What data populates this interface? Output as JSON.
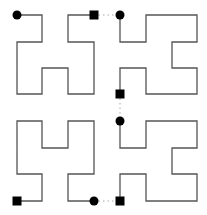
{
  "diagram": {
    "title": "",
    "colors": {
      "path": "#555555",
      "marker": "#000000",
      "connector": "#aaaaaa",
      "background": "#ffffff"
    },
    "segments": [
      {
        "id": "q1",
        "start_marker": "circle",
        "end_marker": "square",
        "points": [
          [
            17,
            15
          ],
          [
            42,
            15
          ],
          [
            42,
            42
          ],
          [
            17,
            42
          ],
          [
            17,
            94
          ],
          [
            42,
            94
          ],
          [
            42,
            68
          ],
          [
            68,
            68
          ],
          [
            68,
            94
          ],
          [
            94,
            94
          ],
          [
            94,
            42
          ],
          [
            68,
            42
          ],
          [
            68,
            15
          ],
          [
            94,
            15
          ]
        ]
      },
      {
        "id": "q2",
        "start_marker": "circle",
        "end_marker": "square",
        "points": [
          [
            120,
            15
          ],
          [
            120,
            42
          ],
          [
            146,
            42
          ],
          [
            146,
            15
          ],
          [
            197,
            15
          ],
          [
            197,
            42
          ],
          [
            172,
            42
          ],
          [
            172,
            68
          ],
          [
            197,
            68
          ],
          [
            197,
            94
          ],
          [
            146,
            94
          ],
          [
            146,
            68
          ],
          [
            120,
            68
          ],
          [
            120,
            94
          ]
        ]
      },
      {
        "id": "q3",
        "start_marker": "square",
        "end_marker": "circle",
        "points": [
          [
            17,
            201
          ],
          [
            42,
            201
          ],
          [
            42,
            174
          ],
          [
            17,
            174
          ],
          [
            17,
            121
          ],
          [
            42,
            121
          ],
          [
            42,
            148
          ],
          [
            68,
            148
          ],
          [
            68,
            121
          ],
          [
            94,
            121
          ],
          [
            94,
            174
          ],
          [
            68,
            174
          ],
          [
            68,
            201
          ],
          [
            94,
            201
          ]
        ]
      },
      {
        "id": "q4",
        "start_marker": "circle",
        "end_marker": "square",
        "points": [
          [
            120,
            121
          ],
          [
            120,
            148
          ],
          [
            146,
            148
          ],
          [
            146,
            121
          ],
          [
            197,
            121
          ],
          [
            197,
            148
          ],
          [
            172,
            148
          ],
          [
            172,
            174
          ],
          [
            197,
            174
          ],
          [
            197,
            201
          ],
          [
            146,
            201
          ],
          [
            146,
            174
          ],
          [
            120,
            174
          ],
          [
            120,
            201
          ]
        ]
      }
    ],
    "connectors": [
      {
        "from": [
          94,
          15
        ],
        "to": [
          120,
          15
        ]
      },
      {
        "from": [
          120,
          94
        ],
        "to": [
          120,
          121
        ]
      },
      {
        "from": [
          94,
          201
        ],
        "to": [
          120,
          201
        ]
      }
    ]
  }
}
